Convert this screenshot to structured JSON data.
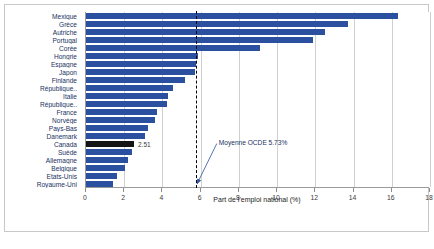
{
  "chart_data": {
    "type": "bar",
    "orientation": "horizontal",
    "title": "",
    "xlabel": "Part de l'emploi national (%)",
    "ylabel": "",
    "xlim": [
      0,
      18
    ],
    "xticks": [
      0,
      2,
      4,
      6,
      8,
      10,
      12,
      14,
      16,
      18
    ],
    "grid": true,
    "legend": false,
    "categories": [
      "Mexique",
      "Grèce",
      "Autriche",
      "Portugal",
      "Corée",
      "Hongrie",
      "Espagne",
      "Japon",
      "Finlande",
      "République..",
      "Italie",
      "République..",
      "France",
      "Norvège",
      "Pays-Bas",
      "Danemark",
      "Canada",
      "Suède",
      "Allemagne",
      "Belgique",
      "Etats-Unis",
      "Royaume-Uni"
    ],
    "values": [
      16.3,
      13.7,
      12.5,
      11.9,
      9.1,
      5.85,
      5.75,
      5.7,
      5.2,
      4.55,
      4.3,
      4.25,
      3.7,
      3.6,
      3.25,
      3.1,
      2.51,
      2.4,
      2.2,
      2.05,
      1.6,
      1.4
    ],
    "highlight_category": "Canada",
    "highlight_color": "#151515",
    "bar_color": "#2c50a0",
    "data_labels": {
      "Canada": "2.51"
    },
    "reference_line": {
      "value": 5.73,
      "style": "dashed",
      "color": "#000000",
      "label": "Moyenne OCDE 5.73%"
    }
  },
  "caption": {
    "text": ""
  }
}
